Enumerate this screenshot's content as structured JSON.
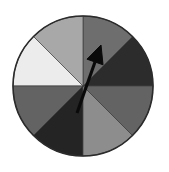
{
  "figure": {
    "name": "spinner-wheel",
    "type": "probability-spinner",
    "background_color": "#ffffff"
  },
  "chart_data": {
    "type": "pie",
    "title": "",
    "subtitle": "",
    "xlabel": "",
    "ylabel": "",
    "legend_position": "none",
    "grid": false,
    "equal_sectors": true,
    "sector_count": 8,
    "sector_angle_degrees": 45,
    "categories": [
      "sector-1",
      "sector-2",
      "sector-3",
      "sector-4",
      "sector-5",
      "sector-6",
      "sector-7",
      "sector-8"
    ],
    "values": [
      45,
      45,
      45,
      45,
      45,
      45,
      45,
      45
    ],
    "sectors": [
      {
        "index": 0,
        "label": "sector-1",
        "start_angle": 0,
        "end_angle": 45,
        "position": "upper-right-lower",
        "color": "#2c2c2c",
        "shade": "very-dark-gray"
      },
      {
        "index": 1,
        "label": "sector-2",
        "start_angle": 45,
        "end_angle": 90,
        "position": "upper-right-upper",
        "color": "#6e6e6e",
        "shade": "medium-dark-gray"
      },
      {
        "index": 2,
        "label": "sector-3",
        "start_angle": 90,
        "end_angle": 135,
        "position": "upper-left-upper",
        "color": "#a8a8a8",
        "shade": "light-medium-gray"
      },
      {
        "index": 3,
        "label": "sector-4",
        "start_angle": 135,
        "end_angle": 180,
        "position": "upper-left-lower",
        "color": "#ececec",
        "shade": "near-white"
      },
      {
        "index": 4,
        "label": "sector-5",
        "start_angle": 180,
        "end_angle": 225,
        "position": "lower-left-upper",
        "color": "#636363",
        "shade": "medium-gray"
      },
      {
        "index": 5,
        "label": "sector-6",
        "start_angle": 225,
        "end_angle": 270,
        "position": "lower-left-lower",
        "color": "#242424",
        "shade": "very-dark-gray"
      },
      {
        "index": 6,
        "label": "sector-7",
        "start_angle": 270,
        "end_angle": 315,
        "position": "lower-right-lower",
        "color": "#8d8d8d",
        "shade": "medium-light-gray"
      },
      {
        "index": 7,
        "label": "sector-8",
        "start_angle": 315,
        "end_angle": 360,
        "position": "lower-right-upper",
        "color": "#636363",
        "shade": "medium-gray"
      }
    ],
    "geometry": {
      "center_x": 83,
      "center_y": 86,
      "radius": 70,
      "outline_color": "#2b2b2b"
    },
    "pointer": {
      "name": "spinner-arrow",
      "color": "#0a0a0a",
      "direction_degrees": 65,
      "points_to_sector": "sector-1",
      "tail_x": 77,
      "tail_y": 113,
      "tip_x": 101,
      "tip_y": 45
    }
  }
}
